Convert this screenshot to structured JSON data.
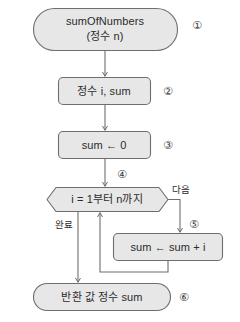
{
  "diagram": {
    "style": {
      "shape_fill": "#e7e7e7",
      "shape_stroke": "#6e6e6e",
      "arrow_color": "#6e6e6e",
      "text_color": "#2b2b2b",
      "background": "#ffffff"
    },
    "nodes": [
      {
        "id": "start",
        "shape": "terminal",
        "lines": [
          "sumOfNumbers",
          "(정수 n)"
        ],
        "marker": "①"
      },
      {
        "id": "declare",
        "shape": "process",
        "lines": [
          "정수 i, sum"
        ],
        "marker": "②"
      },
      {
        "id": "init",
        "shape": "process",
        "lines": [
          "sum ← 0"
        ],
        "marker": "③"
      },
      {
        "id": "loop",
        "shape": "loop-hexagon",
        "lines": [
          "i = 1부터 n까지"
        ],
        "marker": "④"
      },
      {
        "id": "accumulate",
        "shape": "process",
        "lines": [
          "sum ← sum + i"
        ],
        "marker": "⑤"
      },
      {
        "id": "return",
        "shape": "terminal",
        "lines": [
          "반환 값 정수 sum"
        ],
        "marker": "⑥"
      }
    ],
    "edge_labels": {
      "next": "다음",
      "done": "완료"
    }
  }
}
